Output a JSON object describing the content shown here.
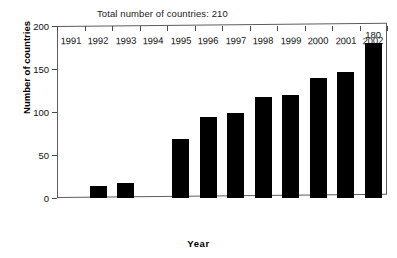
{
  "chart_data": {
    "type": "bar",
    "title": "Total number of countries: 210",
    "xlabel": "Year",
    "ylabel": "Number of countries",
    "categories": [
      "1991",
      "1992",
      "1993",
      "1994",
      "1995",
      "1996",
      "1997",
      "1998",
      "1999",
      "2000",
      "2001",
      "2002"
    ],
    "values": [
      0,
      14,
      17,
      0,
      69,
      94,
      99,
      117,
      120,
      140,
      147,
      180
    ],
    "data_labels": [
      "",
      "",
      "",
      "",
      "",
      "",
      "",
      "",
      "",
      "",
      "",
      "180"
    ],
    "ylim": [
      0,
      200
    ],
    "yticks": [
      0,
      50,
      100,
      150,
      200
    ],
    "ytick_labels": [
      "0",
      "50",
      "100",
      "150",
      "200"
    ],
    "grid": false,
    "legend": false,
    "bar_color": "#000000",
    "frame_color": "#5d5d5d",
    "text_color": "#111111"
  },
  "annotations": {
    "total_countries": "210",
    "last_bar_label": "180"
  }
}
